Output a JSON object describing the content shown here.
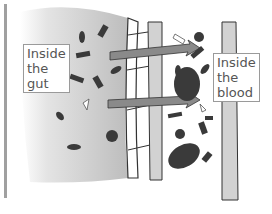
{
  "labels": {
    "gut": [
      "Inside",
      "the",
      "gut"
    ],
    "blood": [
      "Inside",
      "the",
      "blood"
    ]
  },
  "colors": {
    "left_bar": "#9e9e9e",
    "gut_region": "#c4c4c4",
    "wall": "#d2d2d2",
    "particles": "#3a3a3a",
    "arrows": "#8a8a8a",
    "outline": "#333333"
  }
}
